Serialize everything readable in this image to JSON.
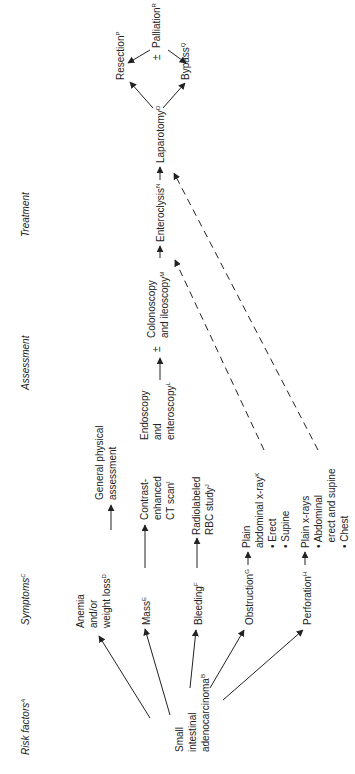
{
  "headers": {
    "risk_factors": "Risk factors",
    "risk_factors_sup": "A",
    "symptoms": "Symptoms",
    "symptoms_sup": "C",
    "assessment": "Assessment",
    "treatment": "Treatment"
  },
  "risk_factor": {
    "lines": [
      "Small",
      "intestinal",
      "adenocarcinoma"
    ],
    "sup": "B"
  },
  "symptoms": [
    {
      "lines": [
        "Anemia",
        "and/or",
        "weight loss"
      ],
      "sup": "D"
    },
    {
      "lines": [
        "Mass"
      ],
      "sup": "E"
    },
    {
      "lines": [
        "Bleeding"
      ],
      "sup": "F"
    },
    {
      "lines": [
        "Obstruction"
      ],
      "sup": "G"
    },
    {
      "lines": [
        "Perforation"
      ],
      "sup": "H"
    }
  ],
  "assessments": [
    {
      "lines": [
        "General physical",
        "assessment"
      ],
      "sup": ""
    },
    {
      "lines": [
        "Contrast-",
        "enhanced",
        "CT scan"
      ],
      "sup": "I"
    },
    {
      "lines": [
        "Radiolabeled",
        "RBC study"
      ],
      "sup": "J"
    },
    {
      "lines": [
        "Plain",
        "abdominal x-ray",
        "• Erect",
        "• Supine"
      ],
      "sup": "K"
    },
    {
      "lines": [
        "Plain x-rays",
        "• Abdominal",
        "  erect and supine",
        "• Chest"
      ],
      "sup": ""
    }
  ],
  "assessment_chain": {
    "endoscopy": {
      "lines": [
        "Endoscopy",
        "and",
        "enteroscopy"
      ],
      "sup": "L"
    },
    "plusminus": "±",
    "colonoscopy": {
      "lines": [
        "Colonoscopy",
        "and ileoscopy"
      ],
      "sup": "M"
    }
  },
  "treatment": {
    "enteroclysis": {
      "label": "Enteroclysis",
      "sup": "N"
    },
    "laparotomy": {
      "label": "Laparotomy",
      "sup": "O"
    },
    "resection": {
      "label": "Resection",
      "sup": "P"
    },
    "bypass": {
      "label": "Bypass",
      "sup": "Q"
    },
    "palliation_prefix": "±",
    "palliation": {
      "label": "Palliation",
      "sup": "R"
    }
  }
}
